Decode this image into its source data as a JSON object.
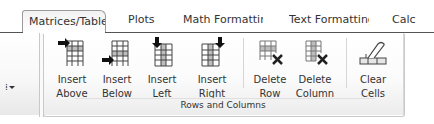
{
  "tabs": [
    {
      "label": "Matrices/Table",
      "active": true
    },
    {
      "label": "Plots",
      "active": false
    },
    {
      "label": "Math Formatting",
      "active": false
    },
    {
      "label": "Text Formatting",
      "active": false
    },
    {
      "label": "Calc",
      "active": false
    }
  ],
  "ribbon": {
    "left_group": {
      "dots": "⁞",
      "dropdown_icon": "chevron-down-icon"
    },
    "group": {
      "label": "Rows and Columns",
      "buttons": [
        {
          "line1": "Insert",
          "line2": "Above",
          "icon": "insert-row-above-icon"
        },
        {
          "line1": "Insert",
          "line2": "Below",
          "icon": "insert-row-below-icon"
        },
        {
          "line1": "Insert",
          "line2": "Left",
          "icon": "insert-column-left-icon"
        },
        {
          "line1": "Insert",
          "line2": "Right",
          "icon": "insert-column-right-icon"
        },
        {
          "line1": "Delete",
          "line2": "Row",
          "icon": "delete-row-icon"
        },
        {
          "line1": "Delete",
          "line2": "Column",
          "icon": "delete-column-icon"
        },
        {
          "line1": "Clear",
          "line2": "Cells",
          "icon": "eraser-icon"
        }
      ]
    }
  }
}
